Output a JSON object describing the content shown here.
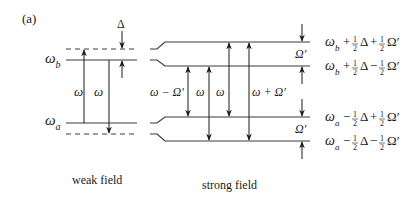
{
  "panel_label": "(a)",
  "weak_field": {
    "caption": "weak field",
    "level_upper": {
      "symbol": "ω",
      "subscript": "b"
    },
    "level_lower": {
      "symbol": "ω",
      "subscript": "a"
    },
    "detuning_label": "Δ",
    "transition_labels": [
      "ω",
      "ω"
    ]
  },
  "strong_field": {
    "caption": "strong field",
    "transition_labels": [
      "ω − Ω′",
      "ω",
      "ω",
      "ω + Ω′"
    ],
    "splitting_label_upper": "Ω′",
    "splitting_label_lower": "Ω′",
    "levels": [
      {
        "base": "ω",
        "sub": "b",
        "sign1": "+",
        "sign2": "+",
        "text": "ω_b + ½Δ + ½Ω′"
      },
      {
        "base": "ω",
        "sub": "b",
        "sign1": "+",
        "sign2": "−",
        "text": "ω_b + ½Δ − ½Ω′"
      },
      {
        "base": "ω",
        "sub": "a",
        "sign1": "−",
        "sign2": "+",
        "text": "ω_a − ½Δ + ½Ω′"
      },
      {
        "base": "ω",
        "sub": "a",
        "sign1": "−",
        "sign2": "−",
        "text": "ω_a − ½Δ − ½Ω′"
      }
    ]
  },
  "colors": {
    "line": "#3a3a3a",
    "text": "#1a1a1a",
    "background": "#ffffff"
  }
}
